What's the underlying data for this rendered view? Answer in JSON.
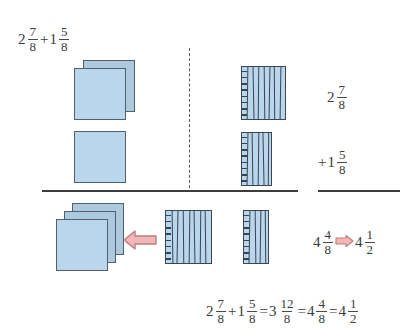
{
  "figure": {
    "title_expression": {
      "parts": [
        {
          "type": "whole",
          "text": "2"
        },
        {
          "type": "fraction",
          "num": "7",
          "den": "8"
        },
        {
          "type": "op",
          "text": "+"
        },
        {
          "type": "whole",
          "text": "1"
        },
        {
          "type": "fraction",
          "num": "5",
          "den": "8"
        }
      ],
      "plain": "2 7/8 + 1 5/8"
    },
    "labels": {
      "row1_label": {
        "whole": "2",
        "num": "7",
        "den": "8",
        "plain": "2 7/8"
      },
      "row2_label": {
        "op": "+",
        "whole": "1",
        "num": "5",
        "den": "8",
        "plain": "+1 5/8"
      },
      "result_label": {
        "left": {
          "whole": "4",
          "num": "4",
          "den": "8",
          "plain": "4 4/8"
        },
        "arrow": "right-arrow-icon",
        "right": {
          "whole": "4",
          "num": "1",
          "den": "2",
          "plain": "4 1/2"
        },
        "plain": "4 4/8 ⇒ 4 1/2"
      }
    },
    "bottom_equation": {
      "parts": [
        {
          "type": "whole",
          "text": "2"
        },
        {
          "type": "fraction",
          "num": "7",
          "den": "8"
        },
        {
          "type": "op",
          "text": "+"
        },
        {
          "type": "whole",
          "text": "1"
        },
        {
          "type": "fraction",
          "num": "5",
          "den": "8"
        },
        {
          "type": "op",
          "text": "="
        },
        {
          "type": "whole",
          "text": "3"
        },
        {
          "type": "fraction",
          "num": "12",
          "den": "8"
        },
        {
          "type": "op",
          "text": "="
        },
        {
          "type": "whole",
          "text": "4"
        },
        {
          "type": "fraction",
          "num": "4",
          "den": "8"
        },
        {
          "type": "op",
          "text": "="
        },
        {
          "type": "whole",
          "text": "4"
        },
        {
          "type": "fraction",
          "num": "1",
          "den": "2"
        }
      ],
      "plain": "2 7/8 + 1 5/8 = 3 12/8 = 4 4/8 = 4 1/2"
    },
    "colors": {
      "square_fill": "#b9d6ec",
      "square_fill_back": "#adc9de",
      "square_border": "#50606e",
      "striped_border": "#3c4650",
      "stripe_line": "#3a4450",
      "arrow_fill": "#f2b7b7",
      "arrow_border": "#c77e7e",
      "rule": "#3d3d3d",
      "dash": "#59595c",
      "text": "#3b3b3b",
      "background": "#ffffff"
    },
    "models": {
      "row1_wholes": {
        "count": 2,
        "name": "two whole squares"
      },
      "row1_fraction": {
        "numerator": 7,
        "denominator": 8,
        "name": "seven eighths strip"
      },
      "row2_wholes": {
        "count": 1,
        "name": "one whole square"
      },
      "row2_fraction": {
        "numerator": 5,
        "denominator": 8,
        "name": "five eighths strip"
      },
      "result_wholes": {
        "count": 3,
        "name": "three whole squares"
      },
      "result_full_eighths": {
        "numerator": 8,
        "denominator": 8,
        "name": "eight eighths strip"
      },
      "result_fraction": {
        "numerator": 4,
        "denominator": 8,
        "name": "four eighths strip"
      }
    }
  }
}
